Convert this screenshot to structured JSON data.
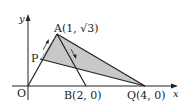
{
  "diagram": {
    "axes": {
      "x_label": "x",
      "y_label": "y",
      "origin_label": "O"
    },
    "points": {
      "A": {
        "label": "A(1, √3)"
      },
      "B": {
        "label": "B(2, 0)"
      },
      "Q": {
        "label": "Q(4, 0)"
      },
      "P": {
        "label": "P"
      }
    },
    "colors": {
      "shade": "#c8c8c8",
      "line": "#222222"
    }
  }
}
